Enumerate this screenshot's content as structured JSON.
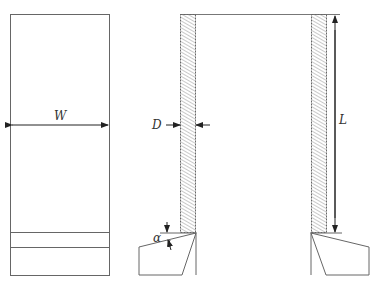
{
  "diagram": {
    "type": "technical-drawing",
    "left_view": {
      "width_label": "W"
    },
    "right_view": {
      "thickness_label": "D",
      "length_label": "L",
      "angle_label": "α"
    },
    "colors": {
      "line": "#555555",
      "hatch": "#888888",
      "background": "#ffffff"
    }
  }
}
